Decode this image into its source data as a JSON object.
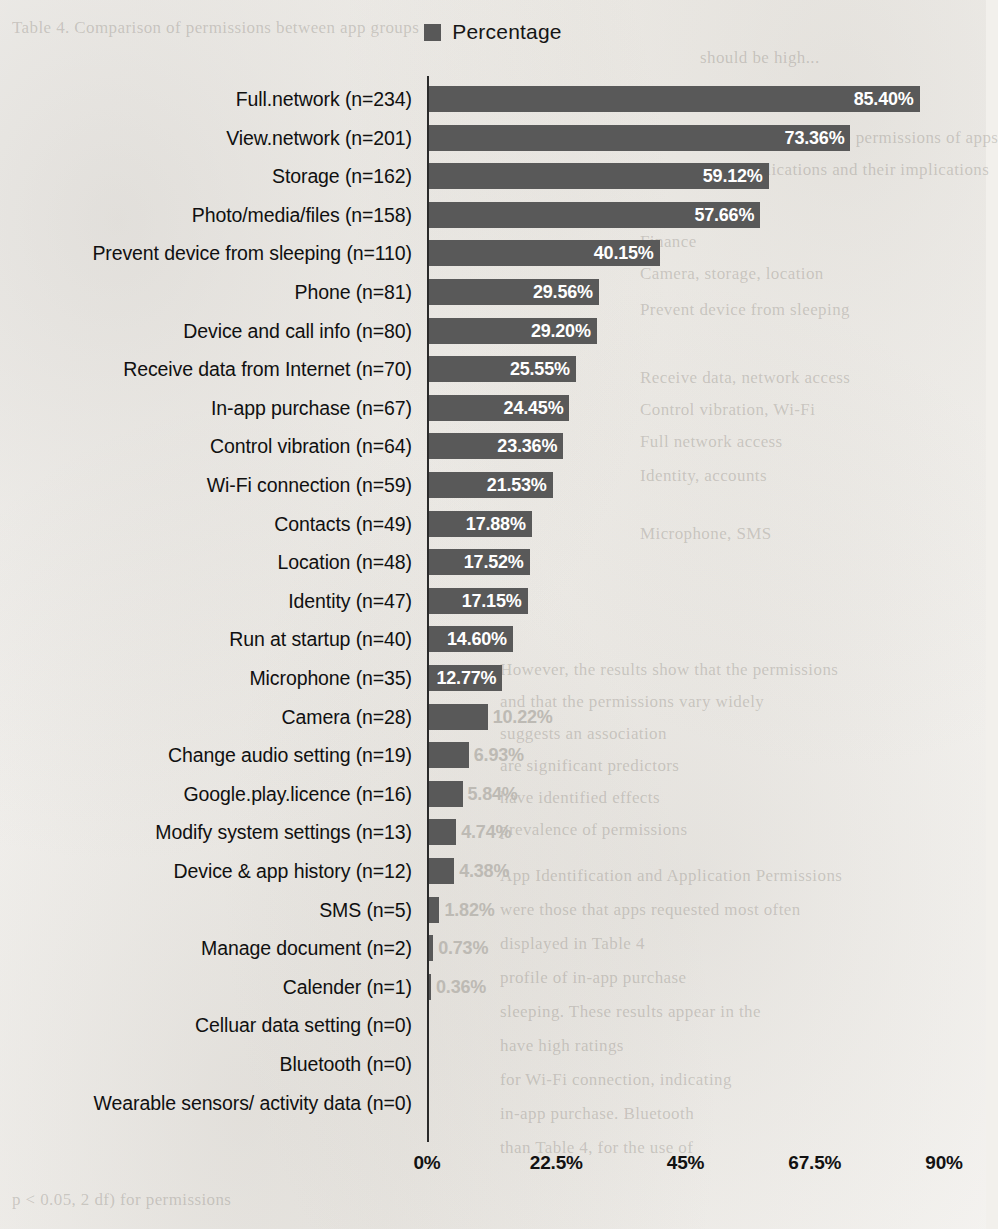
{
  "legend": {
    "label": "Percentage",
    "swatch_color": "#595959"
  },
  "axis": {
    "ticks": [
      "0%",
      "22.5%",
      "45%",
      "67.5%",
      "90%"
    ]
  },
  "chart_data": {
    "type": "bar",
    "orientation": "horizontal",
    "title": "",
    "subtitle": "",
    "xlabel": "",
    "ylabel": "",
    "xlim": [
      0,
      90
    ],
    "grid": false,
    "legend_position": "top-center",
    "series_name": "Percentage",
    "bar_color": "#595959",
    "tick_values": [
      0,
      22.5,
      45,
      67.5,
      90
    ],
    "tick_labels": [
      "0%",
      "22.5%",
      "45%",
      "67.5%",
      "90%"
    ],
    "categories": [
      "Full.network (n=234)",
      "View.network (n=201)",
      "Storage (n=162)",
      "Photo/media/files (n=158)",
      "Prevent device from sleeping (n=110)",
      "Phone (n=81)",
      "Device and call info (n=80)",
      "Receive data from Internet (n=70)",
      "In-app purchase (n=67)",
      "Control vibration (n=64)",
      "Wi-Fi connection (n=59)",
      "Contacts (n=49)",
      "Location (n=48)",
      "Identity (n=47)",
      "Run at startup (n=40)",
      "Microphone (n=35)",
      "Camera (n=28)",
      "Change audio setting (n=19)",
      "Google.play.licence (n=16)",
      "Modify system settings (n=13)",
      "Device & app history (n=12)",
      "SMS (n=5)",
      "Manage document (n=2)",
      "Calender (n=1)",
      "Celluar data setting (n=0)",
      "Bluetooth (n=0)",
      "Wearable sensors/ activity data (n=0)"
    ],
    "values": [
      85.4,
      73.36,
      59.12,
      57.66,
      40.15,
      29.56,
      29.2,
      25.55,
      24.45,
      23.36,
      21.53,
      17.88,
      17.52,
      17.15,
      14.6,
      12.77,
      10.22,
      6.93,
      5.84,
      4.74,
      4.38,
      1.82,
      0.73,
      0.36,
      0.0,
      0.0,
      0.0
    ],
    "value_labels": [
      "85.40%",
      "73.36%",
      "59.12%",
      "57.66%",
      "40.15%",
      "29.56%",
      "29.20%",
      "25.55%",
      "24.45%",
      "23.36%",
      "21.53%",
      "17.88%",
      "17.52%",
      "17.15%",
      "14.60%",
      "12.77%",
      "10.22%",
      "6.93%",
      "5.84%",
      "4.74%",
      "4.38%",
      "1.82%",
      "0.73%",
      "0.36%",
      "",
      "",
      ""
    ],
    "counts": [
      234,
      201,
      162,
      158,
      110,
      81,
      80,
      70,
      67,
      64,
      59,
      49,
      48,
      47,
      40,
      35,
      28,
      19,
      16,
      13,
      12,
      5,
      2,
      1,
      0,
      0,
      0
    ]
  },
  "bleed_text": [
    "Table 4. Comparison of permissions between app groups",
    "should be high...",
    "In this paper, we examine the permissions of apps",
    "major mobile applications and their implications",
    "Group",
    "Finance",
    "Camera, storage, location",
    "Prevent device from sleeping",
    "Receive data, network access",
    "Control vibration, Wi-Fi",
    "Full network access",
    "Identity, accounts",
    "Microphone, SMS",
    "Application Analysis",
    "However, the results show that the permissions",
    "and that the permissions vary widely",
    "suggests an association",
    "are significant predictors",
    "have identified effects",
    "prevalence of permissions",
    "App Identification and Application Permissions",
    "were those that apps requested most often",
    "displayed in Table 4",
    "profile of in-app purchase",
    "sleeping. These results appear in the",
    "have high ratings",
    "for Wi-Fi connection, indicating",
    "in-app purchase. Bluetooth",
    "than Table 4, for the use of",
    "p < 0.05, 2 df) for permissions"
  ]
}
